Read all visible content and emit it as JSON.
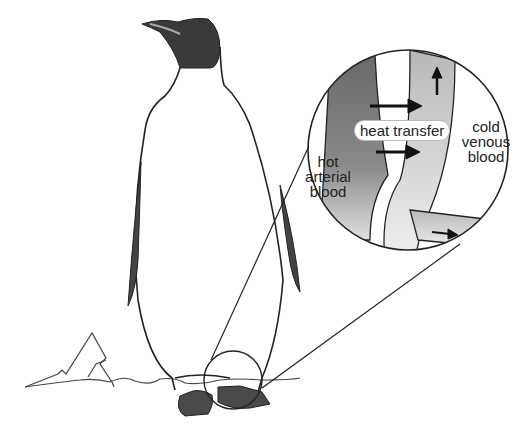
{
  "figure": {
    "labels": {
      "heat_transfer": "heat transfer",
      "hot_arterial": [
        "hot",
        "arterial",
        "blood"
      ],
      "cold_venous": [
        "cold",
        "venous",
        "blood"
      ]
    },
    "caption_partial": "18. Ceratial...  in the illustration ...",
    "colors": {
      "artery_dark": "#6a6a6a",
      "vein_light": "#c8c8c8",
      "outline": "#222222",
      "penguin_head": "#3a3a3a"
    }
  }
}
